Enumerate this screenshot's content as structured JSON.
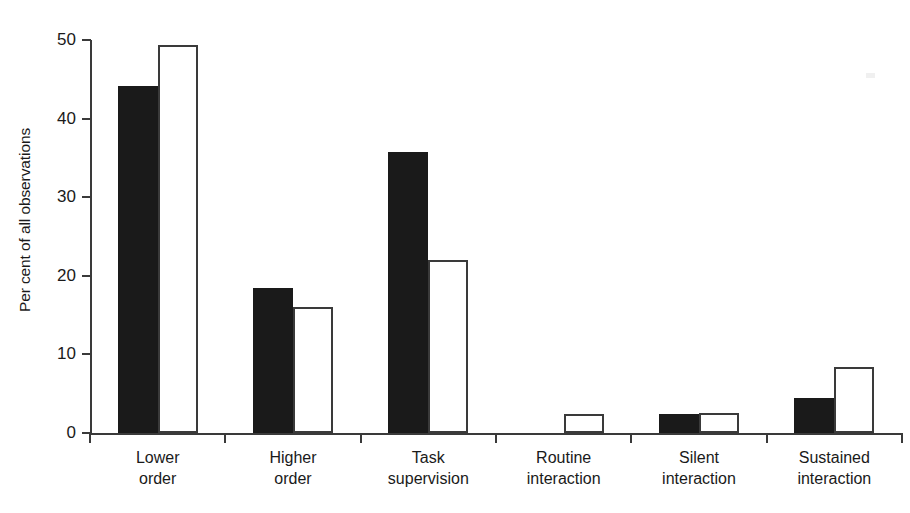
{
  "chart_data": {
    "type": "bar",
    "title": "",
    "subtitle": "",
    "xlabel": "",
    "ylabel": "Per cent of all observations",
    "ylim": [
      0,
      50
    ],
    "ytick_labels": [
      "0",
      "10",
      "20",
      "30",
      "40",
      "50"
    ],
    "yticks": [
      0,
      10,
      20,
      30,
      40,
      50
    ],
    "grid": false,
    "legend": "none",
    "categories": [
      "Lower order",
      "Higher order",
      "Task supervision",
      "Routine interaction",
      "Silent interaction",
      "Sustained interaction"
    ],
    "category_lines": [
      [
        "Lower",
        "order"
      ],
      [
        "Higher",
        "order"
      ],
      [
        "Task",
        "supervision"
      ],
      [
        "Routine",
        "interaction"
      ],
      [
        "Silent",
        "interaction"
      ],
      [
        "Sustained",
        "interaction"
      ]
    ],
    "series": [
      {
        "name": "series-1",
        "style": "solid-black",
        "color": "#1a1a1a",
        "values": [
          44.2,
          18.5,
          35.7,
          0,
          2.4,
          4.4
        ]
      },
      {
        "name": "series-2",
        "style": "hollow-outline",
        "color": "#ffffff",
        "edge_color": "#3a3a3a",
        "values": [
          49.4,
          16.0,
          22.0,
          2.4,
          2.5,
          8.4
        ]
      }
    ]
  },
  "colors": {
    "background": "#ffffff",
    "axis": "#3a3a3a",
    "text": "#1a1a1a",
    "bar_solid": "#1a1a1a",
    "bar_hollow_fill": "#ffffff",
    "bar_hollow_edge": "#3a3a3a"
  }
}
